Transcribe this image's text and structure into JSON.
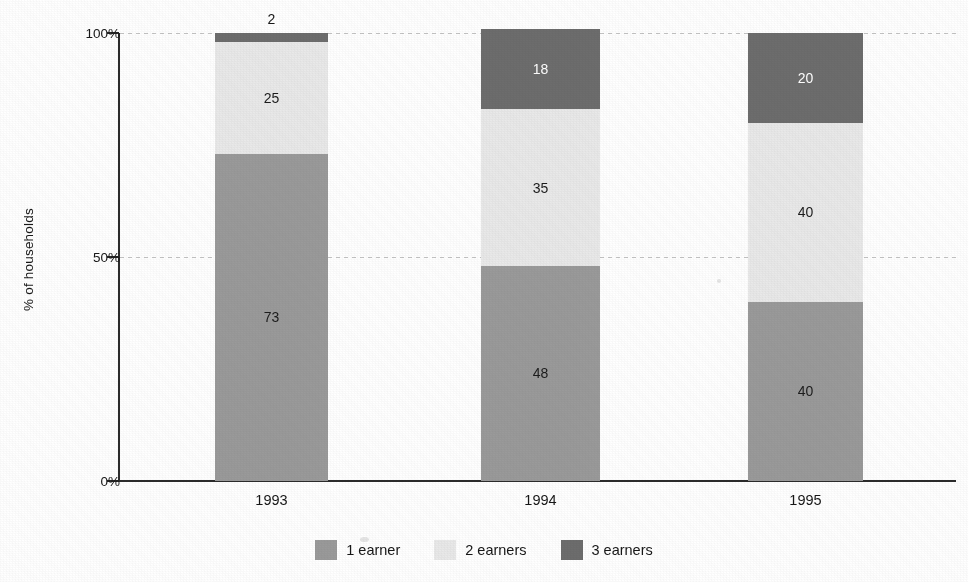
{
  "chart_data": {
    "type": "bar",
    "subtype": "stacked-100-percent",
    "title": "",
    "xlabel": "",
    "ylabel": "% of households",
    "categories": [
      "1993",
      "1994",
      "1995"
    ],
    "ylim": [
      0,
      100
    ],
    "ytick_labels": [
      "0%",
      "50%",
      "100%"
    ],
    "ytick_values": [
      0,
      50,
      100
    ],
    "grid": "horizontal-dotted",
    "legend_position": "bottom-center",
    "series": [
      {
        "name": "1 earner",
        "color": "#9a9a9a",
        "label_color": "#1c1c1c",
        "values": [
          73,
          48,
          40
        ],
        "value_labels": [
          "73",
          "48",
          "40"
        ]
      },
      {
        "name": "2 earners",
        "color": "#e9e9e9",
        "label_color": "#1c1c1c",
        "values": [
          25,
          35,
          40
        ],
        "value_labels": [
          "25",
          "35",
          "40"
        ]
      },
      {
        "name": "3 earners",
        "color": "#6d6d6d",
        "label_color": "#ffffff",
        "values": [
          2,
          18,
          20
        ],
        "value_labels": [
          "2",
          "18",
          "20"
        ],
        "label_outside": [
          true,
          false,
          false
        ],
        "outside_label_color": "#171717"
      }
    ]
  },
  "axis": {
    "y_title": "% of households",
    "y_ticks": [
      {
        "label": "100%",
        "value": 100
      },
      {
        "label": "50%",
        "value": 50
      },
      {
        "label": "0%",
        "value": 0
      }
    ],
    "x_categories": [
      "1993",
      "1994",
      "1995"
    ]
  },
  "legend": {
    "items": [
      {
        "label": "1 earner",
        "color": "#9a9a9a"
      },
      {
        "label": "2 earners",
        "color": "#e9e9e9"
      },
      {
        "label": "3 earners",
        "color": "#6d6d6d"
      }
    ]
  },
  "bar_labels": {
    "b0_s0": "73",
    "b0_s1": "25",
    "b0_s2": "2",
    "b1_s0": "48",
    "b1_s1": "35",
    "b1_s2": "18",
    "b2_s0": "40",
    "b2_s1": "40",
    "b2_s2": "20"
  }
}
